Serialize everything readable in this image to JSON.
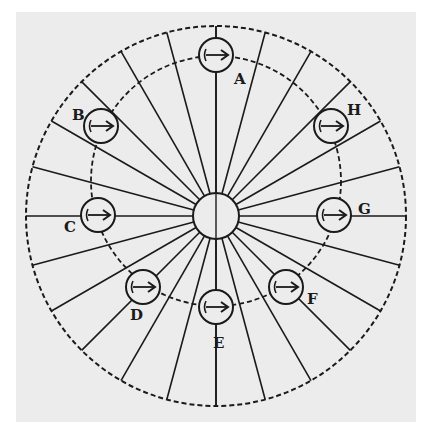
{
  "diagram": {
    "type": "wheel-with-spokes",
    "colors": {
      "ink": "#1a1a1a",
      "paper": "#ececec",
      "background": "#ffffff"
    },
    "center": {
      "x": 216,
      "y": 216
    },
    "hub_radius": 23,
    "outer_circle": {
      "cx": 216,
      "cy": 216,
      "r": 190,
      "style": "dashed"
    },
    "inner_circle": {
      "cx": 216,
      "cy": 181,
      "r": 125,
      "style": "dashed"
    },
    "spoke_count": 24,
    "markers": [
      {
        "id": "A",
        "label": "A",
        "cx": 216,
        "cy": 55,
        "lx": 234,
        "ly": 84
      },
      {
        "id": "B",
        "label": "B",
        "cx": 101,
        "cy": 126,
        "lx": 72,
        "ly": 120
      },
      {
        "id": "C",
        "label": "C",
        "cx": 98,
        "cy": 215,
        "lx": 64,
        "ly": 232
      },
      {
        "id": "D",
        "label": "D",
        "cx": 143,
        "cy": 287,
        "lx": 130,
        "ly": 320
      },
      {
        "id": "E",
        "label": "E",
        "cx": 216,
        "cy": 307,
        "lx": 213,
        "ly": 348
      },
      {
        "id": "F",
        "label": "F",
        "cx": 286,
        "cy": 287,
        "lx": 307,
        "ly": 304
      },
      {
        "id": "G",
        "label": "G",
        "cx": 334,
        "cy": 215,
        "lx": 358,
        "ly": 214
      },
      {
        "id": "H",
        "label": "H",
        "cx": 331,
        "cy": 126,
        "lx": 347,
        "ly": 115
      }
    ],
    "marker_radius": 17,
    "marker_glyph": "arrow-right"
  }
}
